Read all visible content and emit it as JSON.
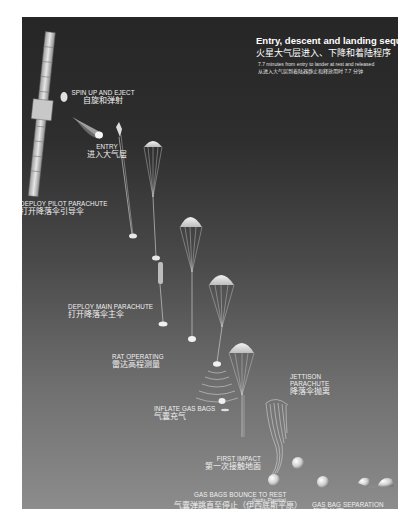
{
  "header": {
    "title_en": "Entry, descent and landing sequence",
    "title_zh": "火星大气层进入、下降和着陆程序",
    "subtitle_en": "7.7 minutes from entry to lander at rest and released",
    "subtitle_zh": "从进入大气层到着陆器静止和释放用时 7.7 分钟"
  },
  "stages": [
    {
      "id": "spin",
      "label_en": "SPIN UP AND EJECT",
      "label_zh": "自旋和弹射"
    },
    {
      "id": "entry",
      "label_en": "ENTRY",
      "label_zh": "进入大气层"
    },
    {
      "id": "pilot",
      "label_en": "DEPLOY PILOT PARACHUTE",
      "label_zh": "打开降落伞引导伞"
    },
    {
      "id": "main",
      "label_en": "DEPLOY MAIN PARACHUTE",
      "label_zh": "打开降落伞主伞"
    },
    {
      "id": "radar",
      "label_en": "RAT  OPERATING",
      "label_zh": "雷达高程测量"
    },
    {
      "id": "inflate",
      "label_en": "INFLATE GAS BAGS",
      "label_zh": "气囊充气"
    },
    {
      "id": "jettison",
      "label_en": "JETTISON PARACHUTE",
      "label_en_line1": "JETTISON",
      "label_en_line2": "PARACHUTE",
      "label_zh": "降落伞抛离"
    },
    {
      "id": "impact",
      "label_en": "FIRST IMPACT",
      "label_zh": "第一次接触地面"
    },
    {
      "id": "bounce",
      "label_en": "GAS BAGS BOUNCE TO REST",
      "label_note": "(Isidis Planitia)",
      "label_zh": "气囊弹跳直至停止（伊西底斯平原）"
    },
    {
      "id": "separation",
      "label_en": "GAS BAG SEPARATION",
      "label_zh": "气囊分离"
    }
  ],
  "colors": {
    "bg_top": "#262626",
    "bg_bottom": "#8c8c8c",
    "text": "#f0f0f0",
    "object": "#e8e8e8"
  }
}
